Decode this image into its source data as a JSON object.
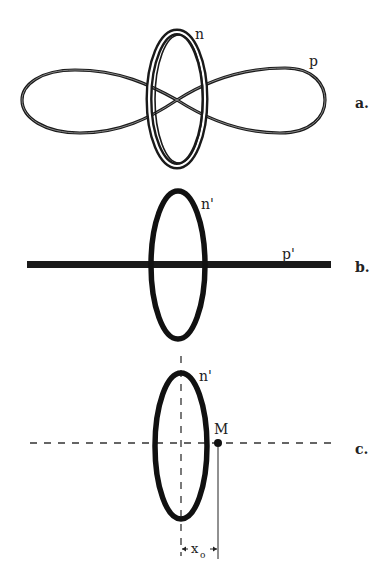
{
  "figure": {
    "colors": {
      "ink": "#1a1a1a",
      "ring_gap": "#ffffff",
      "dash": "#333333"
    },
    "panels": [
      {
        "id": "a",
        "label": "a.",
        "orbital_n_label": "n",
        "orbital_p_label": "p",
        "description": "ring-shaped n orbital intersecting a figure-eight p orbital"
      },
      {
        "id": "b",
        "label": "b.",
        "orbital_n_label": "n'",
        "orbital_p_label": "p'",
        "description": "ellipse n' crossed by thick horizontal bar p'"
      },
      {
        "id": "c",
        "label": "c.",
        "orbital_n_label": "n'",
        "point_label": "M",
        "distance_label": "x",
        "distance_subscript": "o",
        "description": "ellipse n' with dashed axes, point M at distance x_o from center"
      }
    ]
  }
}
